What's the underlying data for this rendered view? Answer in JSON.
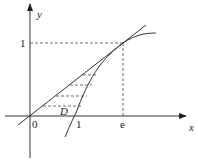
{
  "diagram": {
    "axes": {
      "x_label": "x",
      "y_label": "y",
      "origin_label": "0"
    },
    "tick_labels": {
      "x_one": "1",
      "x_e": "e",
      "y_one": "1"
    },
    "region_label": "D",
    "curves": [
      {
        "name": "natural-log-curve",
        "equation": "y = ln x"
      },
      {
        "name": "tangent-line",
        "equation": "y = x/e"
      }
    ],
    "tangent_point": {
      "x": "e",
      "y": "1"
    }
  }
}
